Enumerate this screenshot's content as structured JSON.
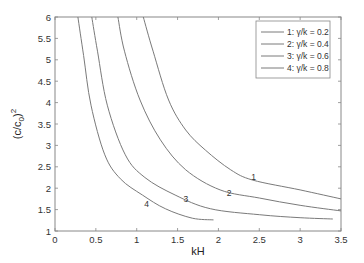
{
  "chart_data": {
    "type": "line",
    "title": "",
    "xlabel": "kH",
    "ylabel": "(c/c0)^2",
    "ylabel_parts": {
      "base": "(c/c",
      "sub": "0",
      "close": ")",
      "sup": "2"
    },
    "xlim": [
      0,
      3.5
    ],
    "ylim": [
      1,
      6
    ],
    "xticks": [
      0,
      0.5,
      1,
      1.5,
      2,
      2.5,
      3,
      3.5
    ],
    "xtick_labels": [
      "0",
      "0.5",
      "1",
      "1.5",
      "2",
      "2.5",
      "3",
      "3.5"
    ],
    "yticks": [
      1,
      1.5,
      2,
      2.5,
      3,
      3.5,
      4,
      4.5,
      5,
      5.5,
      6
    ],
    "ytick_labels": [
      "1",
      "1.5",
      "2",
      "2.5",
      "3",
      "3.5",
      "4",
      "4.5",
      "5",
      "5.5",
      "6"
    ],
    "grid": false,
    "legend_position": "upper right",
    "line_color": "#7a7a7a",
    "series": [
      {
        "name": "1: γ/k = 0.2",
        "label": "1",
        "label_at": [
          2.43,
          2.2
        ],
        "x": [
          1.08,
          1.2,
          1.39,
          1.6,
          1.84,
          2.15,
          2.42,
          3.0,
          3.5
        ],
        "y": [
          6.0,
          5.2,
          4.06,
          3.36,
          2.89,
          2.43,
          2.19,
          1.96,
          1.75
        ]
      },
      {
        "name": "2: γ/k = 0.4",
        "label": "2",
        "label_at": [
          2.13,
          1.82
        ],
        "x": [
          0.77,
          0.85,
          1.04,
          1.29,
          1.6,
          2.02,
          2.5,
          3.0,
          3.5
        ],
        "y": [
          6.0,
          5.2,
          4.06,
          3.13,
          2.43,
          1.96,
          1.77,
          1.6,
          1.47
        ]
      },
      {
        "name": "3: γ/k = 0.6",
        "label": "3",
        "label_at": [
          1.6,
          1.68
        ],
        "x": [
          0.45,
          0.52,
          0.64,
          0.86,
          1.1,
          1.47,
          1.9,
          2.5,
          3.0,
          3.4
        ],
        "y": [
          6.0,
          5.2,
          3.94,
          2.78,
          2.25,
          1.84,
          1.52,
          1.38,
          1.31,
          1.28
        ]
      },
      {
        "name": "4: γ/k = 0.8",
        "label": "4",
        "label_at": [
          1.12,
          1.55
        ],
        "x": [
          0.28,
          0.35,
          0.44,
          0.61,
          0.8,
          1.07,
          1.35,
          1.68,
          1.94
        ],
        "y": [
          6.0,
          5.1,
          3.94,
          2.78,
          2.22,
          1.84,
          1.52,
          1.3,
          1.26
        ]
      }
    ]
  }
}
